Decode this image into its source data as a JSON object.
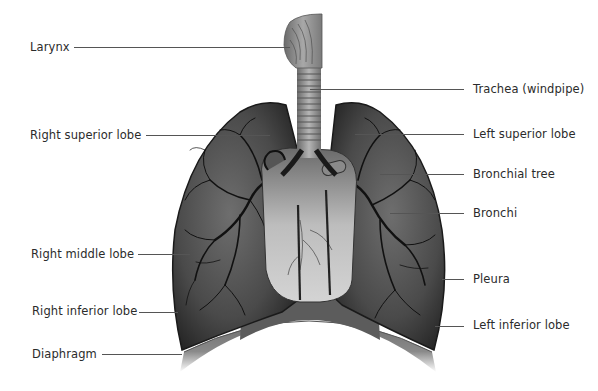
{
  "diagram": {
    "labels_left": [
      {
        "id": "larynx",
        "text": "Larynx",
        "x": 30,
        "y": 40,
        "line_x1": 74,
        "line_x2": 290
      },
      {
        "id": "right-superior-lobe",
        "text": "Right superior lobe",
        "x": 30,
        "y": 129,
        "line_x1": 146,
        "line_x2": 270
      },
      {
        "id": "right-middle-lobe",
        "text": "Right middle lobe",
        "x": 30,
        "y": 247,
        "line_x1": 138,
        "line_x2": 190
      },
      {
        "id": "right-inferior-lobe",
        "text": "Right inferior lobe",
        "x": 32,
        "y": 304,
        "line_x1": 139,
        "line_x2": 178
      },
      {
        "id": "diaphragm",
        "text": "Diaphragm",
        "x": 32,
        "y": 347,
        "line_x1": 102,
        "line_x2": 182
      }
    ],
    "labels_right": [
      {
        "id": "trachea",
        "text": "Trachea (windpipe)",
        "x": 473,
        "y": 82,
        "line_x1": 310,
        "line_x2": 464
      },
      {
        "id": "left-superior-lobe",
        "text": "Left superior lobe",
        "x": 473,
        "y": 128,
        "line_x1": 355,
        "line_x2": 464
      },
      {
        "id": "bronchial-tree",
        "text": "Bronchial tree",
        "x": 473,
        "y": 168,
        "line_x1": 380,
        "line_x2": 464
      },
      {
        "id": "bronchi",
        "text": "Bronchi",
        "x": 473,
        "y": 206,
        "line_x1": 390,
        "line_x2": 464
      },
      {
        "id": "pleura",
        "text": "Pleura",
        "x": 473,
        "y": 272,
        "line_x1": 442,
        "line_x2": 464
      },
      {
        "id": "left-inferior-lobe",
        "text": "Left inferior lobe",
        "x": 473,
        "y": 318,
        "line_x1": 435,
        "line_x2": 464
      }
    ],
    "colors": {
      "label_text": "#2b2b2b",
      "leader_line": "#555555",
      "lung_dark": "#2a2a2a",
      "lung_mid": "#5a5a5a",
      "heart_light": "#c8c8c8",
      "diaphragm": "#7a7a7a",
      "background": "#ffffff"
    }
  }
}
